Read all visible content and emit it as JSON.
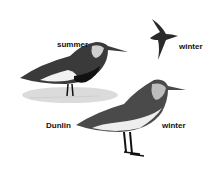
{
  "illustration": {
    "species": "Dunlin",
    "labels": {
      "summer": "summer",
      "winter_flying": "winter",
      "species_name": "Dunlin",
      "winter_standing": "winter"
    }
  }
}
